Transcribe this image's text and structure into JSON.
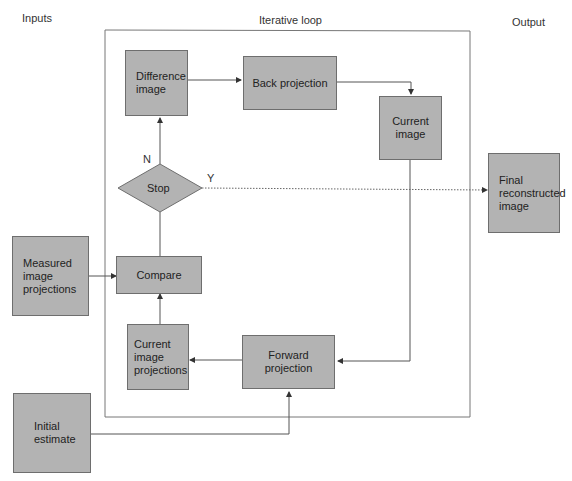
{
  "sections": {
    "inputs": "Inputs",
    "loop": "Iterative loop",
    "output": "Output"
  },
  "nodes": {
    "difference_image": "Difference\nimage",
    "back_projection": "Back projection",
    "current_image": "Current\nimage",
    "stop": "Stop",
    "final_image": "Final\nreconstructed\nimage",
    "measured": "Measured\nimage\nprojections",
    "compare": "Compare",
    "current_projections": "Current\nimage\nprojections",
    "forward_projection": "Forward projection",
    "initial_estimate": "Initial\nestimate"
  },
  "edge_labels": {
    "no": "N",
    "yes": "Y"
  },
  "colors": {
    "box_fill": "#b3b3b3",
    "box_border": "#6e6e6e",
    "line": "#555555"
  }
}
